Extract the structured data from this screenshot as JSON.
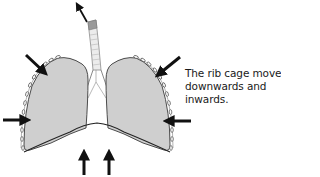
{
  "diagram": {
    "caption_lines": [
      "The rib cage moves",
      "downwards and",
      "inwards."
    ],
    "colors": {
      "lung_fill": "#cfcfcf",
      "outline": "#3a3a3a",
      "arrow": "#111111",
      "trachea_fill": "#ececec",
      "trachea_top": "#9a9a9a",
      "rib_fill": "#ffffff",
      "text": "#1a1a1a"
    },
    "arrows": [
      {
        "id": "air-out",
        "direction": "up-left",
        "meaning": "air exhaled"
      },
      {
        "id": "upper-left",
        "direction": "down-right",
        "meaning": "rib cage moves inwards"
      },
      {
        "id": "upper-right",
        "direction": "down-left",
        "meaning": "rib cage moves inwards"
      },
      {
        "id": "mid-left",
        "direction": "right",
        "meaning": "rib cage moves inwards"
      },
      {
        "id": "mid-right",
        "direction": "left",
        "meaning": "rib cage moves inwards"
      },
      {
        "id": "diaphragm-left",
        "direction": "up",
        "meaning": "diaphragm moves up"
      },
      {
        "id": "diaphragm-right",
        "direction": "up",
        "meaning": "diaphragm moves up"
      }
    ],
    "parts": [
      "trachea",
      "left-lung",
      "right-lung",
      "rib-cage",
      "diaphragm"
    ]
  }
}
